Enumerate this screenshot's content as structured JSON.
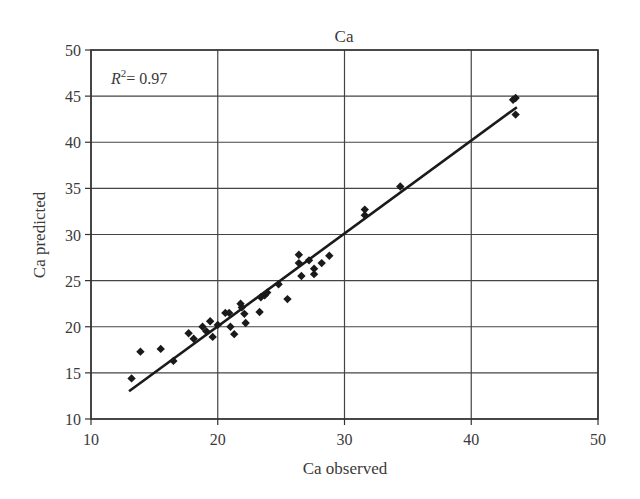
{
  "chart_data": {
    "type": "scatter",
    "title": "Ca",
    "xlabel": "Ca observed",
    "ylabel": "Ca predicted",
    "xlim": [
      10,
      50
    ],
    "ylim": [
      10,
      50
    ],
    "xticks": [
      10,
      20,
      30,
      40,
      50
    ],
    "yticks": [
      10,
      15,
      20,
      25,
      30,
      35,
      40,
      45,
      50
    ],
    "grid": true,
    "legend": null,
    "annotations": [
      {
        "text": "R² = 0.97",
        "x": 12,
        "y": 47
      }
    ],
    "series": [
      {
        "name": "samples",
        "marker": "diamond",
        "color": "#1a1a1a",
        "points": [
          [
            13.2,
            14.4
          ],
          [
            13.9,
            17.3
          ],
          [
            15.5,
            17.6
          ],
          [
            16.5,
            16.3
          ],
          [
            17.7,
            19.3
          ],
          [
            18.1,
            18.7
          ],
          [
            18.8,
            20.0
          ],
          [
            19.1,
            19.5
          ],
          [
            19.4,
            20.6
          ],
          [
            19.6,
            18.9
          ],
          [
            20.0,
            20.2
          ],
          [
            20.6,
            21.5
          ],
          [
            20.9,
            21.5
          ],
          [
            21.0,
            20.0
          ],
          [
            21.3,
            19.2
          ],
          [
            21.8,
            22.5
          ],
          [
            21.9,
            22.1
          ],
          [
            22.1,
            21.4
          ],
          [
            22.2,
            20.4
          ],
          [
            23.3,
            21.6
          ],
          [
            23.4,
            23.2
          ],
          [
            23.7,
            23.4
          ],
          [
            23.9,
            23.7
          ],
          [
            24.8,
            24.6
          ],
          [
            25.5,
            23.0
          ],
          [
            26.4,
            27.8
          ],
          [
            26.4,
            26.9
          ],
          [
            26.6,
            25.5
          ],
          [
            27.2,
            27.2
          ],
          [
            27.6,
            26.3
          ],
          [
            27.6,
            25.7
          ],
          [
            28.2,
            26.9
          ],
          [
            28.8,
            27.7
          ],
          [
            31.6,
            32.7
          ],
          [
            31.6,
            32.1
          ],
          [
            34.4,
            35.2
          ],
          [
            43.3,
            44.6
          ],
          [
            43.5,
            44.8
          ],
          [
            43.5,
            43.0
          ]
        ]
      }
    ],
    "trendline": {
      "type": "linear",
      "x": [
        13.0,
        43.6
      ],
      "y": [
        13.0,
        43.8
      ],
      "r2": 0.97,
      "color": "#1a1a1a"
    }
  }
}
